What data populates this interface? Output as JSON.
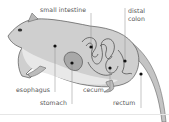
{
  "diagram": {
    "labels": {
      "small_intestine": "small intestine",
      "distal_colon_line1": "distal",
      "distal_colon_line2": "colon",
      "esophagus": "esophagus",
      "stomach": "stomach",
      "cecum": "cecum",
      "rectum": "rectum"
    },
    "colors": {
      "background": "#ffffff",
      "label_text": "#555555",
      "leader_line": "#888888",
      "marker_dot": "#111111",
      "body_fill": "#cfcfcf",
      "body_outline": "#555555",
      "organ_fill": "#a8a8a8"
    }
  }
}
